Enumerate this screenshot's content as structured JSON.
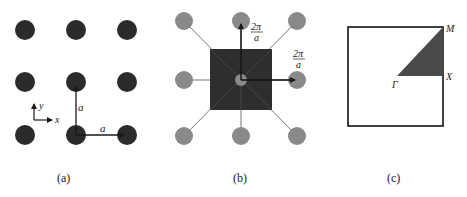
{
  "colors": {
    "lattice_point": "#2b2b2b",
    "reciprocal_point": "#8a8a8a",
    "brillouin_zone": "#2e2e2e",
    "irreducible_zone": "#4a4a4a",
    "line": "#1a1a1a"
  },
  "panel_a": {
    "caption": "(a)",
    "axis_x_label": "x",
    "axis_y_label": "y",
    "lattice_vector_x_label": "a",
    "lattice_vector_y_label": "a",
    "description": "3x3 square real-space lattice"
  },
  "panel_b": {
    "caption": "(b)",
    "vector_up_label_num": "2π",
    "vector_up_label_den": "a",
    "vector_right_label_num": "2π",
    "vector_right_label_den": "a",
    "description": "Reciprocal lattice with first Brillouin zone"
  },
  "panel_c": {
    "caption": "(c)",
    "point_gamma": "Γ",
    "point_x": "X",
    "point_m": "M",
    "description": "First Brillouin zone with irreducible wedge"
  }
}
